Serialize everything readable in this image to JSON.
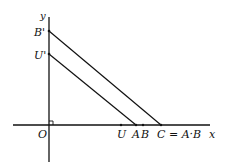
{
  "diagram": {
    "axes": {
      "x_label": "x",
      "y_label": "y",
      "origin_label": "O"
    },
    "y_axis_points": [
      {
        "id": "B_prime",
        "label": "B'"
      },
      {
        "id": "U_prime",
        "label": "U'"
      }
    ],
    "x_axis_points": [
      {
        "id": "U",
        "label": "U"
      },
      {
        "id": "A",
        "label": "A"
      },
      {
        "id": "B",
        "label": "B"
      },
      {
        "id": "C",
        "label": "C = A·B"
      }
    ],
    "lines": [
      {
        "from": "B'",
        "to": "C"
      },
      {
        "from": "U'",
        "to": "A"
      }
    ],
    "colors": {
      "stroke": "#111111",
      "background": "#ffffff"
    }
  }
}
